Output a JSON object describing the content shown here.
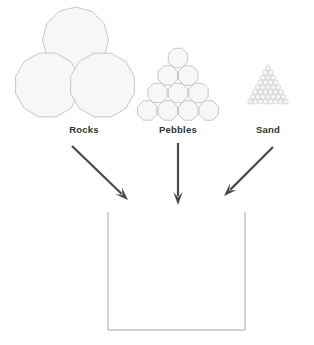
{
  "diagram": {
    "background_color": "#ffffff",
    "shape_fill_color": "#f7f7f7",
    "shape_stroke_color": "#b9b9b9",
    "arrow_color": "#4a4a4a",
    "label_color": "#333333",
    "container_stroke_color": "#a8a8a8",
    "sources": [
      {
        "key": "rocks",
        "label": "Rocks",
        "label_x": 84,
        "label_y": 133,
        "icon_name": "rocks-cluster-icon",
        "shape": "polygon-cluster",
        "count": 3,
        "sides": 12,
        "radius": 33,
        "centers": [
          {
            "cx": 75.5,
            "cy": 40
          },
          {
            "cx": 47.5,
            "cy": 85
          },
          {
            "cx": 102.5,
            "cy": 85
          }
        ]
      },
      {
        "key": "pebbles",
        "label": "Pebbles",
        "label_x": 178,
        "label_y": 133,
        "icon_name": "pebbles-pyramid-icon",
        "shape": "polygon-pyramid",
        "sides": 8,
        "radius": 10.5,
        "rows": [
          1,
          2,
          3,
          4
        ],
        "apex_x": 178,
        "apex_y": 58,
        "row_spacing": 17.5,
        "col_spacing": 20.5
      },
      {
        "key": "sand",
        "label": "Sand",
        "label_x": 268,
        "label_y": 133,
        "icon_name": "sand-grain-triangle-icon",
        "shape": "circle-pyramid",
        "radius": 2.45,
        "rows": [
          1,
          2,
          3,
          4,
          5,
          6,
          7,
          8
        ],
        "apex_x": 268,
        "apex_y": 68,
        "row_spacing": 4.8,
        "col_spacing": 5.1
      }
    ],
    "arrows": [
      {
        "key": "rocks-arrow",
        "name": "arrow-rocks-to-container",
        "x1": 72,
        "y1": 146,
        "x2": 128,
        "y2": 200,
        "head_size": 9
      },
      {
        "key": "pebbles-arrow",
        "name": "arrow-pebbles-to-container",
        "x1": 178,
        "y1": 143,
        "x2": 178,
        "y2": 205,
        "head_size": 9
      },
      {
        "key": "sand-arrow",
        "name": "arrow-sand-to-container",
        "x1": 273,
        "y1": 147,
        "x2": 224,
        "y2": 196,
        "head_size": 9
      }
    ],
    "container": {
      "name": "container-box",
      "left": 108,
      "right": 245,
      "top": 212,
      "bottom": 330,
      "open_top": true,
      "stroke_width": 1
    }
  }
}
